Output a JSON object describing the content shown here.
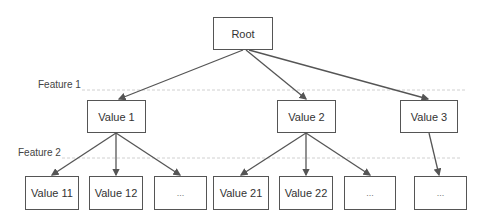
{
  "diagram": {
    "type": "decision-tree",
    "root": {
      "label": "Root"
    },
    "levels": [
      {
        "label": "Feature 1"
      },
      {
        "label": "Feature 2"
      }
    ],
    "level1": [
      {
        "label": "Value 1"
      },
      {
        "label": "Value 2"
      },
      {
        "label": "Value 3"
      }
    ],
    "level2": [
      {
        "label": "Value 11",
        "parent": "Value 1"
      },
      {
        "label": "Value 12",
        "parent": "Value 1"
      },
      {
        "label": "...",
        "parent": "Value 1"
      },
      {
        "label": "Value 21",
        "parent": "Value 2"
      },
      {
        "label": "Value 22",
        "parent": "Value 2"
      },
      {
        "label": "...",
        "parent": "Value 2"
      },
      {
        "label": "...",
        "parent": "Value 3"
      }
    ],
    "colors": {
      "stroke": "#555555",
      "text": "#333333",
      "divider": "#cccccc"
    }
  }
}
